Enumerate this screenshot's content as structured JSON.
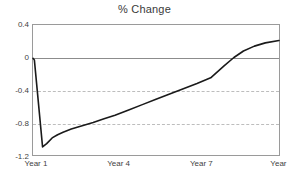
{
  "chart_data": {
    "type": "line",
    "title": "% Change",
    "xlabel": "",
    "ylabel": "",
    "grid": true,
    "legend": "none",
    "xlim": [
      1,
      10
    ],
    "ylim": [
      -1.2,
      0.4
    ],
    "yticks": [
      "0.4",
      "0",
      "-0.4",
      "-0.8",
      "-1.2"
    ],
    "ytick_values": [
      0.4,
      0,
      -0.4,
      -0.8,
      -1.2
    ],
    "xticks": [
      "Year 1",
      "Year 4",
      "Year 7",
      "Year 10"
    ],
    "xtick_values": [
      1,
      4,
      7,
      10
    ],
    "gridline_values": [
      -0.4,
      -0.8
    ],
    "zero_line_value": 0,
    "series": [
      {
        "name": "% Change",
        "color": "#1a1a1a",
        "x": [
          1.0,
          1.05,
          1.35,
          1.5,
          1.7,
          1.9,
          2.1,
          2.4,
          2.8,
          3.2,
          3.6,
          4.0,
          4.5,
          5.0,
          5.5,
          6.0,
          6.5,
          7.0,
          7.5,
          8.0,
          8.35,
          8.7,
          9.1,
          9.5,
          10.0
        ],
        "y": [
          -0.01,
          -0.03,
          -1.1,
          -1.06,
          -0.99,
          -0.95,
          -0.92,
          -0.88,
          -0.84,
          -0.8,
          -0.755,
          -0.71,
          -0.645,
          -0.58,
          -0.515,
          -0.45,
          -0.385,
          -0.32,
          -0.25,
          -0.1,
          0.0,
          0.08,
          0.14,
          0.18,
          0.21
        ]
      }
    ]
  },
  "axis_colors": {
    "frame": "#9a9a9a",
    "gridline": "#bdbdbd",
    "zero_line": "#8c8c8c",
    "line": "#1a1a1a",
    "text": "#3f3f3f"
  }
}
